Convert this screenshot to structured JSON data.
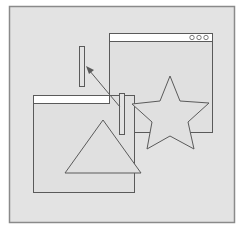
{
  "diagram": {
    "colors": {
      "background": "#ffffff",
      "panel": "#e3e3e3",
      "panel_border": "#8a8a8a",
      "stroke": "#5a5a5a",
      "titlebar": "#ffffff"
    },
    "elements": {
      "back_window": {
        "titlebar_buttons": 3
      },
      "front_window": {
        "titlebar_buttons": 0
      },
      "star": {
        "points": 5
      },
      "triangle": {
        "type": "equilateral"
      },
      "bar_top": {
        "orientation": "vertical"
      },
      "bar_bottom": {
        "orientation": "vertical"
      },
      "arrow": {
        "from": "bar_bottom",
        "to": "bar_top"
      }
    }
  }
}
